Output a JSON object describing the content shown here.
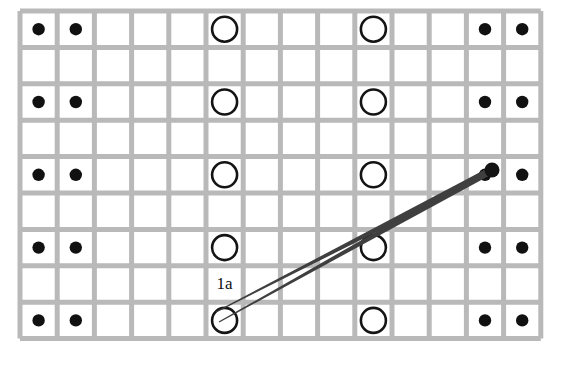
{
  "figure": {
    "background_color": "#ffffff",
    "grid": {
      "columns": 14,
      "rows": 9,
      "origin_x": 20,
      "origin_y": 11,
      "cell_width": 37.2,
      "cell_height": 36.4,
      "line_color": "#b9b9b9",
      "line_width": 5
    },
    "markers": {
      "dot": {
        "name": "filled-dot",
        "color": "#111111",
        "radius": 6.2,
        "columns": [
          1,
          2,
          13,
          14
        ],
        "rows": [
          1,
          3,
          5,
          7,
          9
        ]
      },
      "circle": {
        "name": "open-circle",
        "stroke_color": "#141414",
        "fill_color": "#ffffff",
        "radius": 12.5,
        "stroke_width": 2.6,
        "columns": [
          6,
          10
        ],
        "rows": [
          1,
          3,
          5,
          7,
          9
        ]
      }
    },
    "labels": [
      {
        "text": "1a",
        "column": 6,
        "row": 8,
        "color": "#111111",
        "font_size": 17
      }
    ],
    "pointers": {
      "color": "#3f3f3f",
      "node_color": "#141414",
      "node_radius": 7.5,
      "node_x": 492,
      "node_y": 170,
      "lines": [
        {
          "name": "pointer-line-upper",
          "tail_x": 216,
          "tail_y": 312,
          "tail_half_width": 0.6,
          "head_half_width": 3.6
        },
        {
          "name": "pointer-line-lower",
          "tail_x": 219,
          "tail_y": 322,
          "tail_half_width": 0.6,
          "head_half_width": 3.6
        }
      ]
    }
  }
}
